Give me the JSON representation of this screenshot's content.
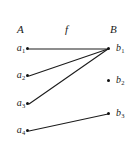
{
  "diagram": {
    "type": "function-mapping-diagram",
    "width": 140,
    "height": 151,
    "background_color": "#ffffff",
    "ink_color": "#1a1a1a",
    "headers": {
      "domain_label": "A",
      "map_label": "f",
      "codomain_label": "B"
    },
    "domain": {
      "name": "A",
      "nodes": [
        {
          "id": "a1",
          "base": "a",
          "sub": "1",
          "x": 27,
          "y": 48,
          "label_x": 3,
          "label_y": 43
        },
        {
          "id": "a2",
          "base": "a",
          "sub": "2",
          "x": 27,
          "y": 75,
          "label_x": 3,
          "label_y": 70
        },
        {
          "id": "a3",
          "base": "a",
          "sub": "3",
          "x": 27,
          "y": 103,
          "label_x": 3,
          "label_y": 98
        },
        {
          "id": "a4",
          "base": "a",
          "sub": "4",
          "x": 27,
          "y": 130,
          "label_x": 3,
          "label_y": 125
        }
      ]
    },
    "codomain": {
      "name": "B",
      "nodes": [
        {
          "id": "b1",
          "base": "b",
          "sub": "1",
          "x": 108,
          "y": 48,
          "label_x": 116,
          "label_y": 43
        },
        {
          "id": "b2",
          "base": "b",
          "sub": "2",
          "x": 108,
          "y": 80,
          "label_x": 116,
          "label_y": 75
        },
        {
          "id": "b3",
          "base": "b",
          "sub": "3",
          "x": 108,
          "y": 113,
          "label_x": 116,
          "label_y": 108
        }
      ]
    },
    "edges": [
      {
        "id": "edge-a1-b1",
        "from": "a1",
        "to": "b1",
        "x1": 29,
        "y1": 49,
        "x2": 108,
        "y2": 49
      },
      {
        "id": "edge-a2-b1",
        "from": "a2",
        "to": "b1",
        "x1": 29,
        "y1": 76,
        "x2": 108,
        "y2": 49
      },
      {
        "id": "edge-a3-b1",
        "from": "a3",
        "to": "b1",
        "x1": 29,
        "y1": 104,
        "x2": 108,
        "y2": 49
      },
      {
        "id": "edge-a4-b3",
        "from": "a4",
        "to": "b3",
        "x1": 29,
        "y1": 131,
        "x2": 108,
        "y2": 114
      }
    ]
  }
}
